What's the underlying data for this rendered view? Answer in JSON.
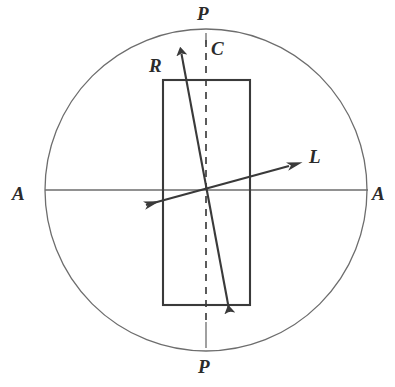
{
  "figure": {
    "kind": "schematic-diagram",
    "title": "",
    "background_color": "#ffffff",
    "width": 395,
    "height": 387
  },
  "colors": {
    "circle_stroke": "#6d6d6d",
    "axis_stroke": "#6d6d6d",
    "rect_stroke": "#3a3a3a",
    "dashed_stroke": "#4a4a4a",
    "vector_stroke": "#3a3a3a",
    "label_color": "#2b2b2b"
  },
  "labels": {
    "p_top": "P",
    "p_bottom": "P",
    "a_left": "A",
    "a_right": "A",
    "c": "C",
    "r": "R",
    "l": "L"
  },
  "geometry": {
    "circle": {
      "cx": 206,
      "cy": 190,
      "r": 161
    },
    "rectangle": {
      "x": 163,
      "y": 80,
      "width": 87,
      "height": 225
    },
    "center": {
      "x": 206,
      "y": 192
    },
    "horizontal_axis": {
      "x1": 45,
      "y1": 190,
      "x2": 368,
      "y2": 190
    },
    "vertical_axis": {
      "x1": 206,
      "y1": 33,
      "x2": 206,
      "y2": 348
    },
    "dashed_axis": {
      "x1": 206,
      "y1": 44,
      "x2": 206,
      "y2": 322
    },
    "vector_r": {
      "x1": 231,
      "y1": 320,
      "x2": 180,
      "y2": 45
    },
    "vector_l": {
      "x1": 135,
      "y1": 208,
      "x2": 300,
      "y2": 163
    }
  },
  "label_positions": {
    "p_top": {
      "x": 197,
      "y": 4
    },
    "p_bottom": {
      "x": 198,
      "y": 357
    },
    "a_left": {
      "x": 12,
      "y": 184
    },
    "a_right": {
      "x": 372,
      "y": 184
    },
    "c": {
      "x": 211,
      "y": 39
    },
    "r": {
      "x": 149,
      "y": 56
    },
    "l": {
      "x": 309,
      "y": 147
    }
  }
}
